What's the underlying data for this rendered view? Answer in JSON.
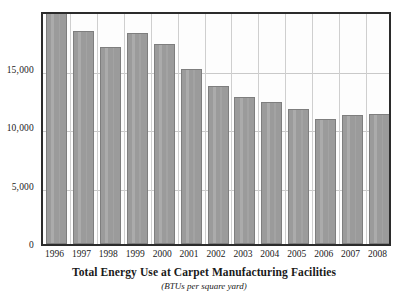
{
  "chart_data": {
    "type": "bar",
    "title": "Total Energy Use at Carpet Manufacturing Facilities",
    "subtitle": "(BTUs per square yard)",
    "xlabel": "",
    "ylabel": "",
    "categories": [
      "1996",
      "1997",
      "1998",
      "1999",
      "2000",
      "2001",
      "2002",
      "2003",
      "2004",
      "2005",
      "2006",
      "2007",
      "2008"
    ],
    "values": [
      19800,
      18200,
      16800,
      18000,
      17100,
      15000,
      13500,
      12600,
      12100,
      11500,
      10700,
      11000,
      11100
    ],
    "ylim": [
      0,
      20000
    ],
    "yticks": [
      0,
      5000,
      10000,
      15000
    ],
    "ytick_labels": [
      "0",
      "5,000",
      "10,000",
      "15,000"
    ],
    "grid": "horizontal-and-vertical",
    "legend": "none",
    "bar_color": "#9b9b9b",
    "bar_border_color": "#7e7e7e",
    "grid_color": "#c9c9c9",
    "frame_color": "#2b2b2b",
    "background_color": "#ffffff"
  }
}
